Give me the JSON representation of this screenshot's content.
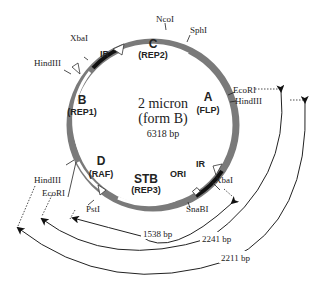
{
  "title": {
    "line1": "2 micron",
    "line2": "(form B)",
    "size": "6318 bp"
  },
  "genes": [
    {
      "id": "A",
      "name": "(FLP)"
    },
    {
      "id": "B",
      "name": "(REP1)"
    },
    {
      "id": "C",
      "name": "(REP2)"
    },
    {
      "id": "D",
      "name": "(RAF)"
    },
    {
      "id": "STB",
      "name": "(REP3)"
    }
  ],
  "regions": {
    "ir_top": "IR",
    "ir_right": "IR",
    "ori": "ORI"
  },
  "sites": {
    "ncoi": "NcoI",
    "sphi": "SphI",
    "ecori_right": "EcoRI",
    "hindiii_right": "HindIII",
    "xbai_right": "XbaI",
    "snabi": "SnaBI",
    "psti": "PstI",
    "ecori_left": "EcoRI",
    "hindiii_left": "HindIII",
    "xbai_top": "XbaI",
    "hindiii_top": "HindIII"
  },
  "fragments": [
    {
      "label": "1538 bp"
    },
    {
      "label": "2241 bp"
    },
    {
      "label": "2211 bp"
    }
  ],
  "colors": {
    "gene_band": "#7a7a7a",
    "ir": "#111111",
    "line": "#222222"
  }
}
